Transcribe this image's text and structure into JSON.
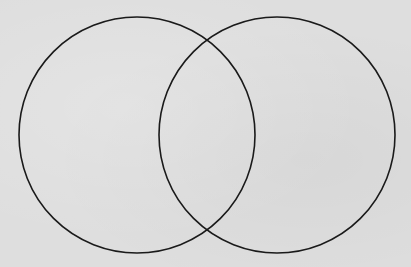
{
  "diagram": {
    "type": "venn",
    "sets": [
      {
        "id": "left",
        "label": "",
        "cx": 137,
        "cy": 135,
        "r": 118
      },
      {
        "id": "right",
        "label": "",
        "cx": 277,
        "cy": 135,
        "r": 118
      }
    ],
    "intersection_label": "",
    "colors": {
      "background": "#dedede",
      "stroke": "#1a1a1a"
    }
  }
}
